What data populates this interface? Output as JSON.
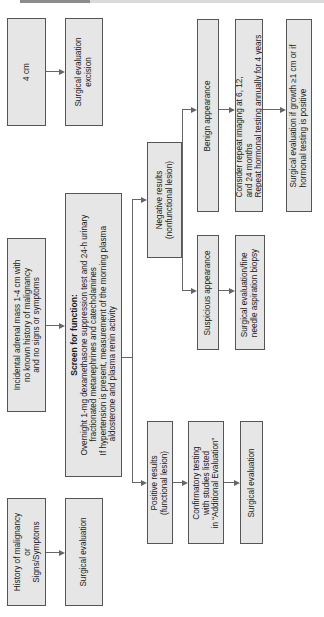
{
  "diagram": {
    "type": "flowchart",
    "orientation": "rotated-90-ccw",
    "colors": {
      "box_fill": "#e6e6e6",
      "box_border": "#555555",
      "connector": "#666666"
    },
    "nodes": {
      "gt4cm": {
        "text": "4 cm"
      },
      "surgical_excision": {
        "lines": [
          "Surgical evaluation",
          "excision"
        ]
      },
      "incidental": {
        "lines": [
          "Incidental adrenal mass 1-4 cm with",
          "no known history of malignancy",
          "and no signs or symptoms"
        ]
      },
      "screen": {
        "title": "Screen for function:",
        "lines": [
          "Overnight 1-mg dexamethasone suppression test and 24-h urinary",
          "fractionated metanephrines and catecholamines",
          "If hypertension is present, measurement of the morning plasma",
          "aldosterone and plasma renin activity"
        ]
      },
      "history": {
        "lines": [
          "History of malignancy",
          "or",
          "Signs/Symptoms"
        ]
      },
      "surgical_eval_history": {
        "text": "Surgical evaluation"
      },
      "negative": {
        "lines": [
          "Negative results",
          "(nonfunctional lesion)"
        ]
      },
      "positive": {
        "lines": [
          "Positive results",
          "(functional lesion)"
        ]
      },
      "benign": {
        "text": "Benign appearance"
      },
      "consider": {
        "lines": [
          "Consider repeat imaging at 6, 12,",
          "and 24 months",
          "Repeat hormonal testing annually for 4 years"
        ]
      },
      "surgical_if_growth": {
        "lines": [
          "Surgical evaluation if growth ≥1 cm or if",
          "hormonal testing is positive"
        ]
      },
      "suspicious": {
        "text": "Suspicious appearance"
      },
      "fna": {
        "lines": [
          "Surgical evaluation/fine",
          "needle aspiration biopsy"
        ]
      },
      "confirmatory": {
        "lines": [
          "Confirmatory testing",
          "with studies listed",
          "in “Additional Evaluation”"
        ]
      },
      "surgical_eval_positive": {
        "text": "Surgical evaluation"
      }
    },
    "edges": [
      [
        "gt4cm",
        "surgical_excision"
      ],
      [
        "incidental",
        "screen"
      ],
      [
        "history",
        "surgical_eval_history"
      ],
      [
        "screen",
        "negative"
      ],
      [
        "screen",
        "positive"
      ],
      [
        "negative",
        "benign"
      ],
      [
        "negative",
        "suspicious"
      ],
      [
        "benign",
        "consider"
      ],
      [
        "consider",
        "surgical_if_growth"
      ],
      [
        "suspicious",
        "fna"
      ],
      [
        "positive",
        "confirmatory"
      ],
      [
        "confirmatory",
        "surgical_eval_positive"
      ]
    ]
  }
}
